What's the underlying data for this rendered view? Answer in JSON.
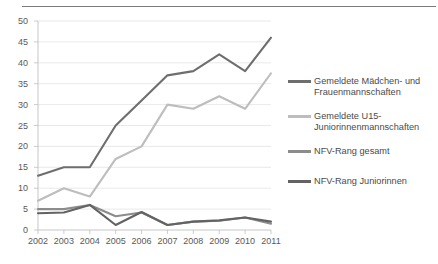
{
  "chart_data": {
    "type": "line",
    "title": "",
    "xlabel": "",
    "ylabel": "",
    "categories": [
      "2002",
      "2003",
      "2004",
      "2005",
      "2006",
      "2007",
      "2008",
      "2009",
      "2010",
      "2011"
    ],
    "x": [
      2002,
      2003,
      2004,
      2005,
      2006,
      2007,
      2008,
      2009,
      2010,
      2011
    ],
    "ylim": [
      0,
      50
    ],
    "ytick_step": 5,
    "yticks": [
      "50",
      "45",
      "40",
      "35",
      "30",
      "25",
      "20",
      "15",
      "10",
      "5",
      "0"
    ],
    "grid": "horizontal",
    "legend_position": "right",
    "series": [
      {
        "name": "Gemeldete Mädchen- und Frauenmannschaften",
        "color": "#6e6e6e",
        "values": [
          13,
          15,
          15,
          25,
          31,
          37,
          38,
          42,
          38,
          46
        ]
      },
      {
        "name": "Gemeldete U15-Juniorinnenmannschaften",
        "color": "#bdbdbd",
        "values": [
          7,
          10,
          8,
          17,
          20,
          30,
          29,
          32,
          29,
          37.5
        ]
      },
      {
        "name": "NFV-Rang gesamt",
        "color": "#8c8c8c",
        "values": [
          5,
          5,
          6,
          3.3,
          4.2,
          1.2,
          2,
          2.2,
          3,
          1.5
        ]
      },
      {
        "name": "NFV-Rang Juniorinnen",
        "color": "#636363",
        "values": [
          4,
          4.2,
          6,
          1.2,
          4.3,
          1.2,
          2,
          2.3,
          3,
          2
        ]
      }
    ]
  },
  "legend": {
    "entries": [
      {
        "label": "Gemeldete Mädchen- und\nFrauenmannschaften",
        "color": "#6e6e6e"
      },
      {
        "label": "Gemeldete U15-\nJuniorinnenmannschaften",
        "color": "#bdbdbd"
      },
      {
        "label": "NFV-Rang gesamt",
        "color": "#8c8c8c"
      },
      {
        "label": "NFV-Rang Juniorinnen",
        "color": "#636363"
      }
    ]
  },
  "axis": {
    "y_tick_labels": [
      "50",
      "45",
      "40",
      "35",
      "30",
      "25",
      "20",
      "15",
      "10",
      "5",
      "0"
    ],
    "x_tick_labels": [
      "2002",
      "2003",
      "2004",
      "2005",
      "2006",
      "2007",
      "2008",
      "2009",
      "2010",
      "2011"
    ]
  }
}
